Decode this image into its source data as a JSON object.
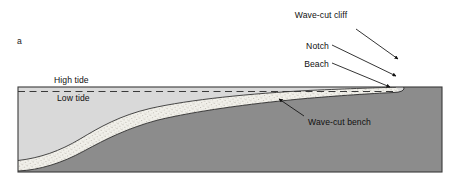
{
  "figure": {
    "panel_letter": "a",
    "labels": {
      "high_tide": "High tide",
      "low_tide": "Low tide",
      "wave_cut_cliff": "Wave-cut cliff",
      "notch": "Notch",
      "beach": "Beach",
      "wave_cut_bench": "Wave-cut bench"
    },
    "colors": {
      "background": "#ffffff",
      "water": "#d9d9d9",
      "bedrock": "#8c8c8c",
      "sediment": "#f0efe9",
      "stipple": "#a8a39a",
      "outline": "#2b2b2b",
      "border": "#3a3a3a",
      "text": "#101010"
    },
    "icons": {
      "leader_line": "leader-line",
      "arrowhead": "arrowhead",
      "dashed_line": "dashed-line"
    },
    "frame": {
      "left": 18,
      "top": 87,
      "right": 442,
      "bottom": 172
    },
    "tide_lines": {
      "high_tide_y": 87,
      "low_tide_y": 92,
      "high_tide_style": "solid",
      "low_tide_style": "dashed"
    }
  }
}
